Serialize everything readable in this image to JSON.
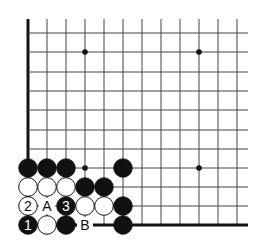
{
  "diagram": {
    "type": "go-board-fragment",
    "corner": "bottom-left",
    "grid": {
      "x_lines": [
        28,
        47,
        66,
        85,
        104,
        123,
        142,
        161,
        180,
        199,
        218,
        237
      ],
      "y_lines": [
        33,
        52,
        72,
        91,
        110,
        130,
        149,
        168,
        187,
        206,
        225
      ],
      "top_start": 19,
      "right_end": 248,
      "line_color": "#444444",
      "edge_color": "#111111"
    },
    "star_points": [
      {
        "x": 85,
        "y": 52
      },
      {
        "x": 199,
        "y": 52
      },
      {
        "x": 85,
        "y": 168
      },
      {
        "x": 199,
        "y": 168
      }
    ],
    "stones": [
      {
        "color": "black",
        "x": 28,
        "y": 168,
        "label": ""
      },
      {
        "color": "black",
        "x": 47,
        "y": 168,
        "label": ""
      },
      {
        "color": "black",
        "x": 66,
        "y": 168,
        "label": ""
      },
      {
        "color": "black",
        "x": 123,
        "y": 168,
        "label": ""
      },
      {
        "color": "white",
        "x": 28,
        "y": 187,
        "label": ""
      },
      {
        "color": "white",
        "x": 47,
        "y": 187,
        "label": ""
      },
      {
        "color": "white",
        "x": 66,
        "y": 187,
        "label": ""
      },
      {
        "color": "black",
        "x": 85,
        "y": 187,
        "label": ""
      },
      {
        "color": "black",
        "x": 104,
        "y": 187,
        "label": ""
      },
      {
        "color": "white",
        "x": 28,
        "y": 206,
        "label": "2"
      },
      {
        "color": "black",
        "x": 66,
        "y": 206,
        "label": "3"
      },
      {
        "color": "white",
        "x": 85,
        "y": 206,
        "label": ""
      },
      {
        "color": "white",
        "x": 104,
        "y": 206,
        "label": ""
      },
      {
        "color": "black",
        "x": 123,
        "y": 206,
        "label": ""
      },
      {
        "color": "black",
        "x": 28,
        "y": 225,
        "label": "1"
      },
      {
        "color": "white",
        "x": 47,
        "y": 225,
        "label": ""
      },
      {
        "color": "black",
        "x": 66,
        "y": 225,
        "label": ""
      },
      {
        "color": "black",
        "x": 123,
        "y": 225,
        "label": ""
      }
    ],
    "markers": [
      {
        "text": "A",
        "x": 47,
        "y": 206
      },
      {
        "text": "B",
        "x": 85,
        "y": 225
      }
    ],
    "labels": {
      "move1": "1",
      "move2": "2",
      "move3": "3",
      "point_a": "A",
      "point_b": "B"
    }
  }
}
